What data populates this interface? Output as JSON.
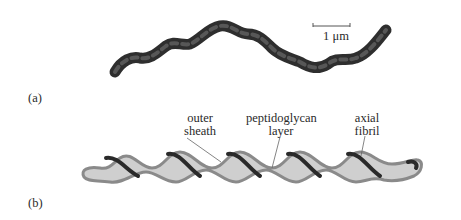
{
  "figure": {
    "panel_a": {
      "label": "(a)",
      "scale_bar": {
        "text": "1 μm"
      }
    },
    "panel_b": {
      "label": "(b)",
      "callouts": [
        {
          "line1": "outer",
          "line2": "sheath"
        },
        {
          "line1": "peptidoglycan",
          "line2": "layer"
        },
        {
          "line1": "axial",
          "line2": "fibril"
        }
      ]
    },
    "colors": {
      "cell_dark": "#3a3a3a",
      "sheath_outline": "#8a8a8a",
      "cytoplasm_fill": "#cfcfcf",
      "fibril": "#2a2a2a"
    }
  }
}
